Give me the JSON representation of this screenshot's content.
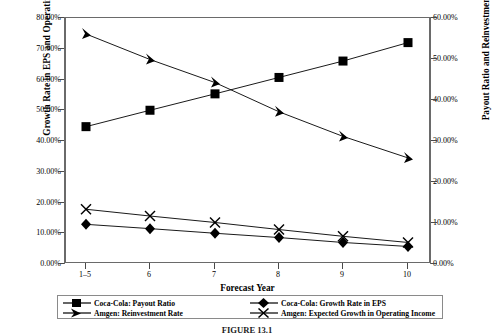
{
  "chart_data": {
    "type": "line",
    "title": "",
    "xlabel": "Forecast Year",
    "ylabel": "Growth Rate in EPS and Operating Income",
    "ylabel_secondary": "Payout Ratio and Reinvestment Rate",
    "categories": [
      "1–5",
      "6",
      "7",
      "8",
      "9",
      "10"
    ],
    "ylim": [
      0,
      0.8
    ],
    "ylim_secondary": [
      0,
      0.6
    ],
    "yticks": [
      "0.00%",
      "10.00%",
      "20.00%",
      "30.00%",
      "40.00%",
      "50.00%",
      "60.00%",
      "70.00%",
      "80.00%"
    ],
    "yticks_secondary": [
      "0.00%",
      "10.00%",
      "20.00%",
      "30.00%",
      "40.00%",
      "50.00%",
      "60.00%"
    ],
    "grid": false,
    "legend_position": "bottom",
    "series": [
      {
        "name": "Coca-Cola: Payout Ratio",
        "marker": "square",
        "axis": "secondary",
        "values": [
          0.335,
          0.375,
          0.415,
          0.455,
          0.495,
          0.54
        ]
      },
      {
        "name": "Coca-Cola: Growth Rate in EPS",
        "marker": "diamond",
        "axis": "primary",
        "values": [
          0.129,
          0.115,
          0.1,
          0.086,
          0.07,
          0.057
        ]
      },
      {
        "name": "Amgen: Reinvestment Rate",
        "marker": "triangle",
        "axis": "primary",
        "values": [
          0.748,
          0.665,
          0.59,
          0.495,
          0.415,
          0.345
        ]
      },
      {
        "name": "Amgen: Expected Growth in Operating Income",
        "marker": "cross",
        "axis": "primary",
        "values": [
          0.178,
          0.156,
          0.135,
          0.112,
          0.09,
          0.07
        ]
      }
    ]
  },
  "axes": {
    "left_title": "Growth Rate in EPS and Operating Income",
    "right_title": "Payout Ratio and Reinvestment Rate",
    "x_title": "Forecast Year",
    "left_ticks": [
      "80.00%",
      "70.00%",
      "60.00%",
      "50.00%",
      "40.00%",
      "30.00%",
      "20.00%",
      "10.00%",
      "0.00%"
    ],
    "right_ticks": [
      "60.00%",
      "50.00%",
      "40.00%",
      "30.00%",
      "20.00%",
      "10.00%",
      "0.00%"
    ],
    "x_ticks": [
      "1–5",
      "6",
      "7",
      "8",
      "9",
      "10"
    ]
  },
  "legend": {
    "items": [
      {
        "label": "Coca-Cola: Payout Ratio",
        "marker": "square"
      },
      {
        "label": "Coca-Cola: Growth Rate in EPS",
        "marker": "diamond"
      },
      {
        "label": "Amgen: Reinvestment Rate",
        "marker": "triangle"
      },
      {
        "label": "Amgen: Expected Growth in Operating Income",
        "marker": "cross"
      }
    ]
  },
  "caption": "FIGURE 13.1",
  "colors": {
    "series": "#000000",
    "axis": "#6a6a6a",
    "background": "#ffffff"
  }
}
